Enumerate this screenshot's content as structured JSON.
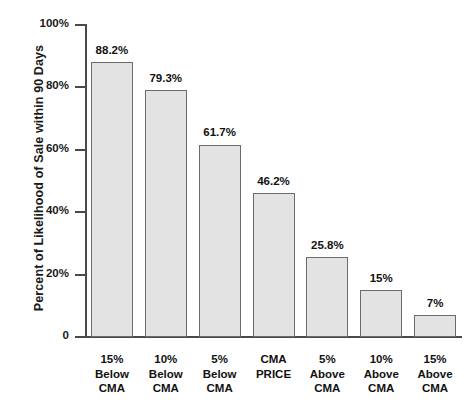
{
  "chart_data": {
    "type": "bar",
    "title": "",
    "subtitle": "",
    "xlabel": "",
    "ylabel": "Percent of Likelihood of Sale within 90 Days",
    "ylim": [
      0,
      100
    ],
    "y_ticks": [
      0,
      20,
      40,
      60,
      80,
      100
    ],
    "y_tick_labels": [
      "0",
      "20%",
      "40%",
      "60%",
      "80%",
      "100%"
    ],
    "grid": false,
    "legend": "none",
    "categories": [
      "15% Below CMA",
      "10% Below CMA",
      "5% Below CMA",
      "CMA PRICE",
      "5% Above CMA",
      "10% Above CMA",
      "15% Above CMA"
    ],
    "category_lines": [
      [
        "15%",
        "Below",
        "CMA"
      ],
      [
        "10%",
        "Below",
        "CMA"
      ],
      [
        "5%",
        "Below",
        "CMA"
      ],
      [
        "CMA",
        "PRICE"
      ],
      [
        "5%",
        "Above",
        "CMA"
      ],
      [
        "10%",
        "Above",
        "CMA"
      ],
      [
        "15%",
        "Above",
        "CMA"
      ]
    ],
    "values": [
      88.2,
      79.3,
      61.7,
      46.2,
      25.8,
      15,
      7
    ],
    "value_labels": [
      "88.2%",
      "79.3%",
      "61.7%",
      "46.2%",
      "25.8%",
      "15%",
      "7%"
    ],
    "colors": {
      "bar_fill": "#e3e3e3",
      "bar_border": "#6b6b6b",
      "axis": "#4a4a4a",
      "text": "#111111",
      "background": "#ffffff"
    }
  }
}
